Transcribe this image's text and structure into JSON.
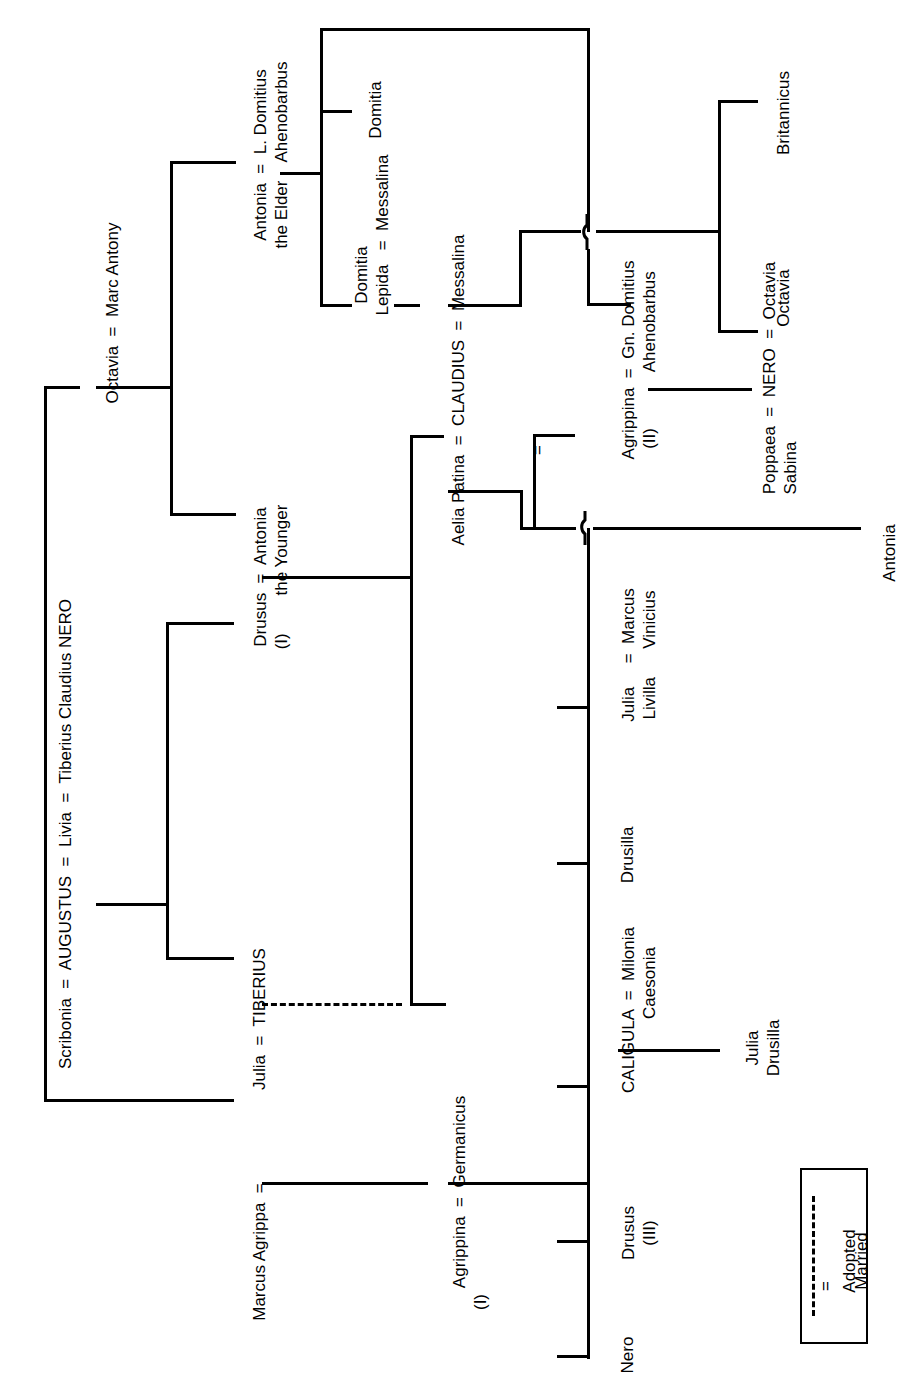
{
  "diagram": {
    "orientation": "rotated-90-ccw",
    "line_color": "#000000",
    "background": "#ffffff"
  },
  "legend": {
    "items": [
      {
        "symbol": "- - - -",
        "label": "Adopted",
        "style": "dashed"
      },
      {
        "symbol": "=",
        "label": "Married",
        "style": "equals"
      }
    ]
  },
  "people": {
    "augustus_row": "Scribonia  =  AUGUSTUS  =  Livia  =  Tiberius Claudius NERO",
    "octavia_antony": "Octavia  =  Marc Antony",
    "julia_tiberius": "Julia  =  TIBERIUS",
    "marcus_agrippa": "Marcus Agrippa  =",
    "drusus_i_l1": "Drusus  =  Antonia",
    "drusus_i_l2": "(I)        the Younger",
    "antonia_elder_l1": "Antonia  =  L. Domitius",
    "antonia_elder_l2": "the Elder    Ahenobarbus",
    "domitia": "Domitia",
    "domitia_lepida_l1": "Domitia",
    "domitia_lepida_l2": "Lepida   =  Messalina",
    "claudius_row": "Aelia Patina  =  CLAUDIUS  =  Messalina",
    "claudius_second_eq": "=",
    "agrippina_ii_l1": "Agrippina  =  Gn. Domitius",
    "agrippina_ii_l2": "(II)            Ahenobarbus",
    "agrippina_i_l1": "Agrippina  =  Germanicus",
    "agrippina_i_l2": "(I)",
    "nero_child": "Nero",
    "drusus_iii_l1": "Drusus",
    "drusus_iii_l2": "(III)",
    "caligula_l1": "CALIGULA  =  Milonia",
    "caligula_l2": "Caesonia",
    "julia_drusilla_l1": "Julia",
    "julia_drusilla_l2": "Drusilla",
    "drusilla": "Drusilla",
    "julia_livilla_l1": "Julia     =  Marcus",
    "julia_livilla_l2": "Livilla      Vinicius",
    "antonia_daughter": "Antonia",
    "poppaea_nero_octavia_l1": "Poppaea  =  NERO  =  Octavia",
    "poppaea_nero_octavia_l2": "Sabina",
    "britannicus": "Britannicus",
    "octavia_child": "Octavia"
  }
}
